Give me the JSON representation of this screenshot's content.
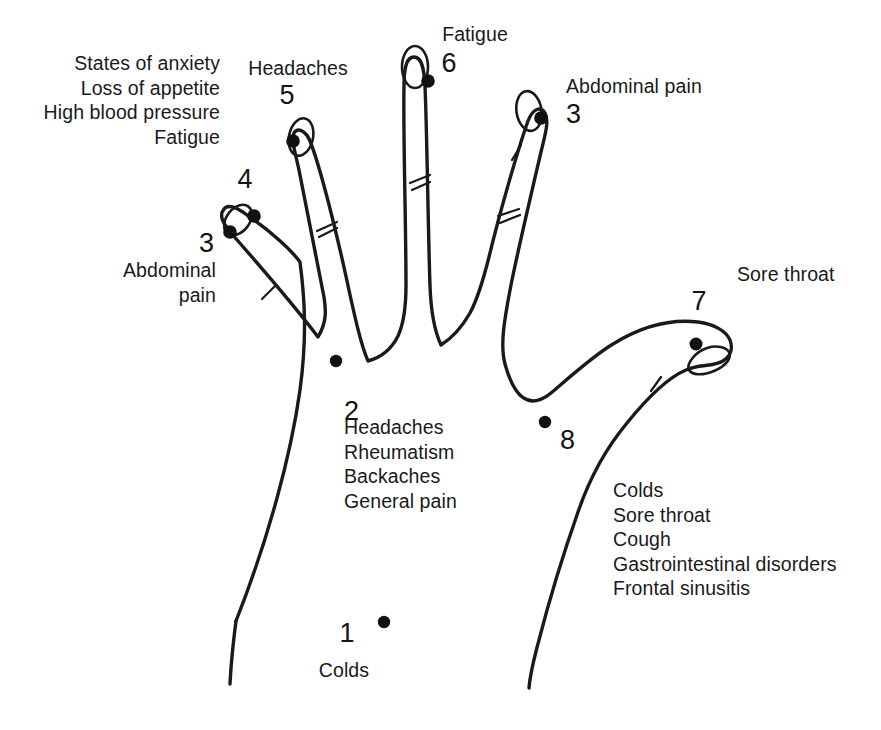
{
  "diagram": {
    "stroke_color": "#1a1a1a",
    "dot_color": "#111111",
    "background_color": "#ffffff"
  },
  "points": [
    {
      "number": "1",
      "ailments": [
        "Colds"
      ],
      "ailments_text": "Colds",
      "location": "base of palm, outer wrist edge",
      "align": "center"
    },
    {
      "number": "2",
      "ailments": [
        "Headaches",
        "Rheumatism",
        "Backaches",
        "General pain"
      ],
      "ailments_text": "Headaches\nRheumatism\nBackaches\nGeneral pain",
      "location": "centre of palm below middle finger",
      "align": "left"
    },
    {
      "number": "3",
      "ailments": [
        "Abdominal pain"
      ],
      "ailments_text": "Abdominal\npain",
      "location": "little finger tip, left hand side",
      "align": "right"
    },
    {
      "number": "4",
      "ailments": [
        "States of anxiety",
        "Loss of appetite",
        "High blood pressure",
        "Fatigue"
      ],
      "ailments_text": "States of anxiety\nLoss of appetite\nHigh blood pressure\nFatigue",
      "location": "little finger tip, inner side",
      "align": "right"
    },
    {
      "number": "5",
      "ailments": [
        "Headaches"
      ],
      "ailments_text": "Headaches",
      "location": "ring finger tip",
      "align": "center"
    },
    {
      "number": "6",
      "ailments": [
        "Fatigue"
      ],
      "ailments_text": "Fatigue",
      "location": "middle finger tip",
      "align": "center"
    },
    {
      "number": "7",
      "ailments": [
        "Sore throat"
      ],
      "ailments_text": "Sore throat",
      "location": "thumb tip",
      "align": "left"
    },
    {
      "number": "8",
      "ailments": [
        "Colds",
        "Sore throat",
        "Cough",
        "Gastrointestinal disorders",
        "Frontal sinusitis"
      ],
      "ailments_text": "Colds\nSore throat\nCough\nGastrointestinal disorders\nFrontal sinusitis",
      "location": "web between thumb and index finger",
      "align": "left"
    }
  ],
  "labels": {
    "point4_list": "States of anxiety\nLoss of appetite\nHigh blood pressure\nFatigue",
    "point4_number": "4",
    "point5_title": "Headaches",
    "point5_number": "5",
    "point6_title": "Fatigue",
    "point6_number": "6",
    "point3_top_title": "Abdominal pain",
    "point3_top_number": "3",
    "point3_left_number": "3",
    "point3_left_list": "Abdominal\npain",
    "point7_title": "Sore throat",
    "point7_number": "7",
    "point2_number": "2",
    "point2_list": "Headaches\nRheumatism\nBackaches\nGeneral pain",
    "point8_number": "8",
    "point8_list": "Colds\nSore throat\nCough\nGastrointestinal disorders\nFrontal sinusitis",
    "point1_number": "1",
    "point1_list": "Colds"
  }
}
